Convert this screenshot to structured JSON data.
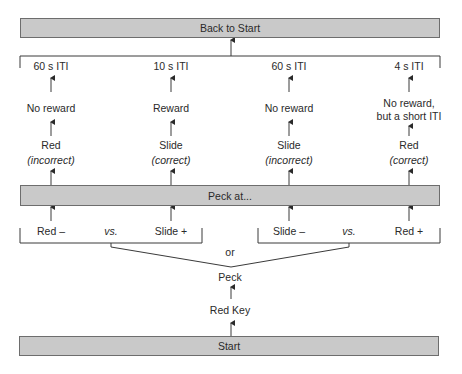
{
  "boxes": {
    "back_to_start": "Back to Start",
    "peck_at": "Peck at...",
    "start": "Start"
  },
  "columns": [
    {
      "iti": "60 s ITI",
      "outcome": "No reward",
      "outcome2": "",
      "choice": "Red",
      "correctness": "(incorrect)"
    },
    {
      "iti": "10 s ITI",
      "outcome": "Reward",
      "outcome2": "",
      "choice": "Slide",
      "correctness": "(correct)"
    },
    {
      "iti": "60 s ITI",
      "outcome": "No reward",
      "outcome2": "",
      "choice": "Slide",
      "correctness": "(incorrect)"
    },
    {
      "iti": "4 s ITI",
      "outcome": "No reward,",
      "outcome2": "but a short ITI",
      "choice": "Red",
      "correctness": "(correct)"
    }
  ],
  "pairs": [
    {
      "left": "Red –",
      "vs": "vs.",
      "right": "Slide +"
    },
    {
      "left": "Slide –",
      "vs": "vs.",
      "right": "Red +"
    }
  ],
  "or_label": "or",
  "peck_label": "Peck",
  "red_key_label": "Red Key",
  "colors": {
    "box_fill": "#c9c9c9",
    "box_border": "#6d6d6d",
    "line": "#3a3a3a"
  }
}
